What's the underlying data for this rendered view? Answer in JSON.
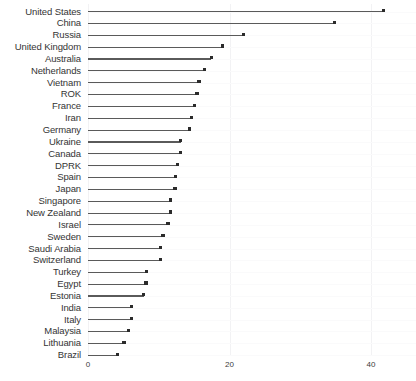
{
  "chart_data": {
    "type": "bar",
    "subtype": "lollipop-horizontal",
    "title": "",
    "subtitle": "",
    "xlabel": "",
    "ylabel": "",
    "xlim": [
      0,
      43
    ],
    "xticks": [
      0,
      20,
      40
    ],
    "xtick_labels": [
      "0",
      "20",
      "40"
    ],
    "grid": true,
    "legend": false,
    "orientation": "horizontal",
    "sorted": "descending",
    "categories": [
      "United States",
      "China",
      "Russia",
      "United Kingdom",
      "Australia",
      "Netherlands",
      "Vietnam",
      "ROK",
      "France",
      "Iran",
      "Germany",
      "Ukraine",
      "Canada",
      "DPRK",
      "Spain",
      "Japan",
      "Singapore",
      "New Zealand",
      "Israel",
      "Sweden",
      "Saudi Arabia",
      "Switzerland",
      "Turkey",
      "Egypt",
      "Estonia",
      "India",
      "Italy",
      "Malaysia",
      "Lithuania",
      "Brazil"
    ],
    "values": [
      41.8,
      34.8,
      22.0,
      19.0,
      17.4,
      16.5,
      15.7,
      15.4,
      15.1,
      14.6,
      14.3,
      13.1,
      13.1,
      12.6,
      12.4,
      12.3,
      11.7,
      11.7,
      11.3,
      10.6,
      10.3,
      10.2,
      8.3,
      8.2,
      7.9,
      6.1,
      6.1,
      5.7,
      5.1,
      4.2
    ],
    "colors": {
      "dot": "#2b2b2b",
      "stem": "#5a5a5a",
      "gridline": "#f2f2f4",
      "text": "#343434",
      "background": "#ffffff"
    }
  }
}
